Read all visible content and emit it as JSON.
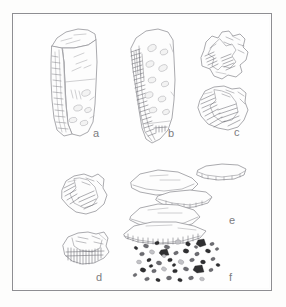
{
  "plate": {
    "kind": "archaeological-lithic-illustration",
    "medium": "pen-and-ink line drawing, pencil hatching",
    "background_color": "#fdfdfc",
    "frame_color": "#8e8e92",
    "ink_color": "#9a9a9e",
    "shade_color": "#6e6e73",
    "dark_fill": "#3a3a3c",
    "figures": [
      {
        "id": "a",
        "label": "a",
        "name": "prismatic-blade-core",
        "description": "Elongated prismatic core in three-quarter view with flat striking platform at top and vertical blade-removal scars down the face"
      },
      {
        "id": "b",
        "label": "b",
        "name": "exhausted-blade-core",
        "description": "Elongated core with heavily hatched left ridge and oval flake scars across the body"
      },
      {
        "id": "c",
        "label": "c",
        "name": "angular-core-fragments",
        "description": "Two blocky angular fragments with dense parallel hatching on the fractured faces"
      },
      {
        "id": "d",
        "label": "d",
        "name": "core-rejuvenation-pieces",
        "description": "Two irregular chunks with fine comb-like hatching along the lower break edges"
      },
      {
        "id": "e",
        "label": "e",
        "name": "flat-flakes-and-platform-tablet",
        "description": "Stack of four flat platform flakes shown in oblique section with a small disc-shaped core tablet at upper right"
      },
      {
        "id": "f",
        "label": "f",
        "name": "microdebitage-scatter",
        "description": "Scatter of about fifty small dark chips and shatter fragments"
      }
    ]
  }
}
